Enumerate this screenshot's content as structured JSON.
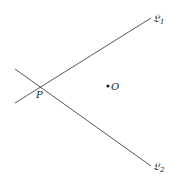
{
  "diagram": {
    "lines": [
      {
        "name": "L1",
        "label": "𝔏",
        "subscript": "1",
        "x1": 15,
        "y1": 103,
        "x2": 151,
        "y2": 18
      },
      {
        "name": "L2",
        "label": "𝔏",
        "subscript": "2",
        "x1": 15,
        "y1": 69,
        "x2": 151,
        "y2": 166
      }
    ],
    "points": [
      {
        "name": "P",
        "label": "P",
        "x": 41,
        "y": 87
      },
      {
        "name": "O",
        "label": "O",
        "x": 108,
        "y": 86
      }
    ],
    "colors": {
      "line": "#444444",
      "text": "#222222",
      "background": "#ffffff"
    }
  }
}
